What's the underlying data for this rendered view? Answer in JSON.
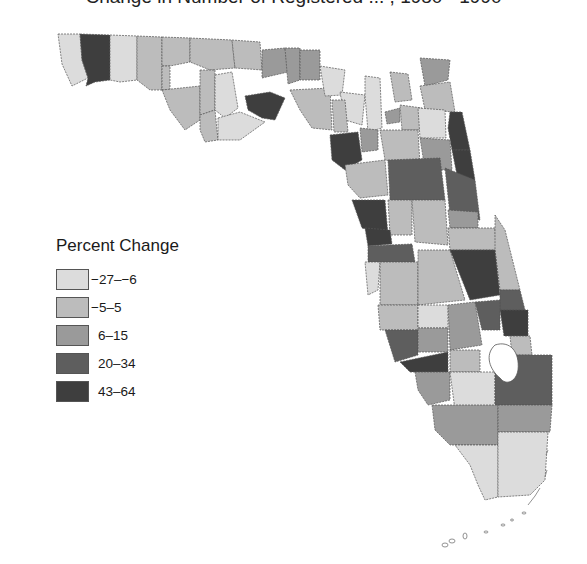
{
  "title": "Change in Number of Registered ... , 1980 - 1990",
  "legend": {
    "title": "Percent Change",
    "items": [
      {
        "label": "−27–−6",
        "color": "#dcdcdc"
      },
      {
        "label": "−5–5",
        "color": "#bcbcbc"
      },
      {
        "label": "6–15",
        "color": "#9a9a9a"
      },
      {
        "label": "20–34",
        "color": "#5e5e5e"
      },
      {
        "label": "43–64",
        "color": "#3e3e3e"
      }
    ]
  },
  "map": {
    "region": "Florida",
    "units": "counties"
  }
}
